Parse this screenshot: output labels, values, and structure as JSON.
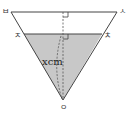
{
  "diagram": {
    "type": "inverted-cone-cross-section",
    "labels": {
      "top_left": "ㅂ",
      "top_right": "ㅅ",
      "water_left": "ㅈ",
      "water_right": "ㅊ",
      "apex": "ㅇ",
      "height": "xcm"
    },
    "colors": {
      "stroke": "#444444",
      "water_fill": "#c8c8c8",
      "background": "#ffffff"
    }
  }
}
